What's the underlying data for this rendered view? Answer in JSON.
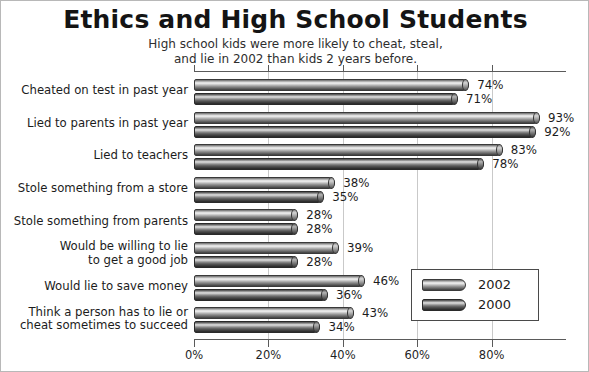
{
  "chart_data": {
    "type": "bar",
    "orientation": "horizontal",
    "title": "Ethics and High School Students",
    "subtitle_lines": [
      "High school kids were more likely to cheat, steal,",
      "and lie in 2002 than kids 2 years before."
    ],
    "xlabel": "",
    "ylabel": "",
    "xlim": [
      0,
      100
    ],
    "xticks": [
      0,
      20,
      40,
      60,
      80
    ],
    "xtick_labels": [
      "0%",
      "20%",
      "40%",
      "60%",
      "80%"
    ],
    "grid": true,
    "grid_axis": "x",
    "legend_position": "lower-right",
    "value_label_suffix": "%",
    "categories": [
      {
        "lines": [
          "Cheated on test in past year"
        ]
      },
      {
        "lines": [
          "Lied to parents in past year"
        ]
      },
      {
        "lines": [
          "Lied to teachers"
        ]
      },
      {
        "lines": [
          "Stole something from a store"
        ]
      },
      {
        "lines": [
          "Stole something from parents"
        ]
      },
      {
        "lines": [
          "Would be willing to lie",
          "to get a good job"
        ]
      },
      {
        "lines": [
          "Would lie to save money"
        ]
      },
      {
        "lines": [
          "Think a person has to lie or",
          "cheat sometimes to succeed"
        ]
      }
    ],
    "series": [
      {
        "name": "2002",
        "color": "#a9a9a9",
        "values": [
          74,
          93,
          83,
          38,
          28,
          39,
          46,
          43
        ],
        "value_labels": [
          "74%",
          "93%",
          "83%",
          "38%",
          "28%",
          "39%",
          "46%",
          "43%"
        ]
      },
      {
        "name": "2000",
        "color": "#6b6b6b",
        "values": [
          71,
          92,
          78,
          35,
          28,
          28,
          36,
          34
        ],
        "value_labels": [
          "71%",
          "92%",
          "78%",
          "35%",
          "28%",
          "28%",
          "36%",
          "34%"
        ]
      }
    ]
  },
  "legend": {
    "entries": [
      {
        "label": "2002"
      },
      {
        "label": "2000"
      }
    ]
  }
}
